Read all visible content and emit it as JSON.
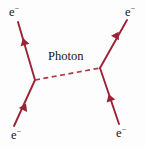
{
  "figure": {
    "type": "feynman-diagram",
    "background_color": "#fdfdfd",
    "fermion_line_color": "#9b2335",
    "photon_line_color": "#b03a4a",
    "label_color": "#181818"
  },
  "labels": {
    "electron_in_top": {
      "symbol": "e",
      "charge": "−"
    },
    "electron_out_top": {
      "symbol": "e",
      "charge": "−"
    },
    "electron_in_bottom": {
      "symbol": "e",
      "charge": "−"
    },
    "electron_out_bottom": {
      "symbol": "e",
      "charge": "−"
    },
    "photon": "Photon"
  },
  "geometry": {
    "vertex_left": {
      "x": 35,
      "y": 80
    },
    "vertex_right": {
      "x": 100,
      "y": 68
    },
    "endpoint_top_left": {
      "x": 18,
      "y": 22
    },
    "endpoint_top_right": {
      "x": 127,
      "y": 20
    },
    "endpoint_bottom_left": {
      "x": 14,
      "y": 126
    },
    "endpoint_bottom_right": {
      "x": 119,
      "y": 124
    },
    "arrow_top_left": {
      "x": 25,
      "y": 45
    },
    "arrow_top_right": {
      "x": 115,
      "y": 38
    },
    "arrow_bottom_left": {
      "x": 23,
      "y": 110
    },
    "arrow_bottom_right": {
      "x": 111,
      "y": 101
    }
  },
  "style": {
    "fermion_stroke_width": 1.9,
    "photon_stroke_width": 1.7,
    "photon_dash_pattern": "5,3.5"
  }
}
